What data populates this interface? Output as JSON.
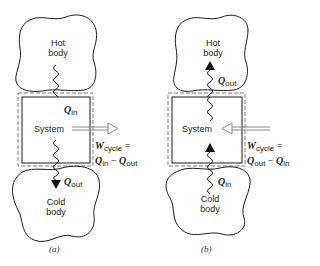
{
  "diagram": {
    "type": "thermodynamic-cycle-schematic",
    "panels": [
      {
        "id": "a",
        "caption": "(a)",
        "hot_body": {
          "line1": "Hot",
          "line2": "body"
        },
        "cold_body": {
          "line1": "Cold",
          "line2": "body"
        },
        "system_label": "System",
        "heat_top": {
          "symbol": "Q",
          "sub": "in",
          "direction": "down"
        },
        "heat_bottom": {
          "symbol": "Q",
          "sub": "out",
          "direction": "down"
        },
        "work": {
          "symbol": "W",
          "sub": "cycle",
          "eq": "=",
          "rhs_a": "Q",
          "rhs_a_sub": "in",
          "minus": "−",
          "rhs_b": "Q",
          "rhs_b_sub": "out",
          "direction": "out"
        }
      },
      {
        "id": "b",
        "caption": "(b)",
        "hot_body": {
          "line1": "Hot",
          "line2": "body"
        },
        "cold_body": {
          "line1": "Cold",
          "line2": "body"
        },
        "system_label": "System",
        "heat_top": {
          "symbol": "Q",
          "sub": "out",
          "direction": "up"
        },
        "heat_bottom": {
          "symbol": "Q",
          "sub": "in",
          "direction": "up"
        },
        "work": {
          "symbol": "W",
          "sub": "cycle",
          "eq": "=",
          "rhs_a": "Q",
          "rhs_a_sub": "out",
          "minus": "−",
          "rhs_b": "Q",
          "rhs_b_sub": "in",
          "direction": "in"
        }
      }
    ],
    "colors": {
      "line": "#1a1a1a",
      "dash": "#555555",
      "arrow_fill": "#111111",
      "work_arrow": "#888888"
    }
  }
}
